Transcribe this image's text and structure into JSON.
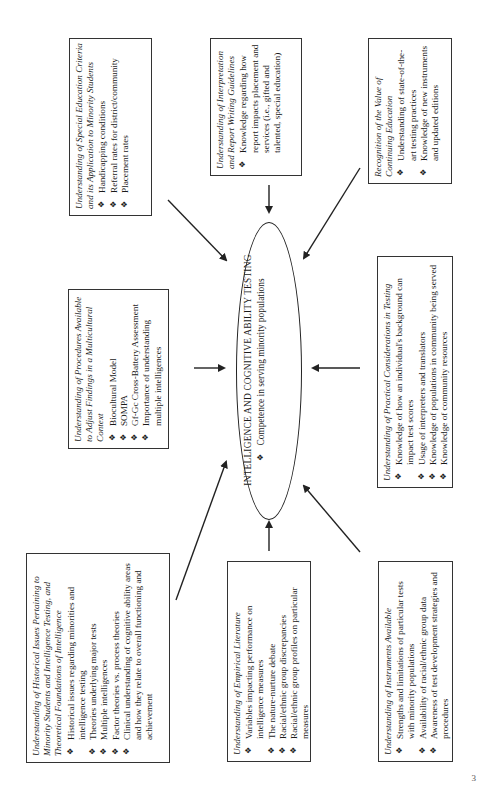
{
  "center": {
    "title": "INTELLIGENCE AND COGNITIVE ABILITY TESTING",
    "bullets": [
      "Competence in serving minority populations"
    ]
  },
  "boxes": {
    "special_education": {
      "title": "Understanding of Special Education Criteria and its Application to Minority Students",
      "bullets": [
        "Handicapping conditions",
        "Referral rates for district/community",
        "Placement rates"
      ]
    },
    "interpretation": {
      "title": "Understanding of Interpretation and Report Writing Guidelines",
      "bullets": [
        "Knowledge regarding how report impacts placement and services (i.e., gifted and talented, special education)"
      ]
    },
    "continuing_education": {
      "title": "Recognition of the Value of Continuing Education",
      "bullets": [
        "Understanding of state-of-the-art testing practices",
        "Knowledge of new instruments and updated editions"
      ]
    },
    "procedures": {
      "title": "Understanding of Procedures Available to Adjust Findings in a Multicultural Context",
      "bullets": [
        "Biocultural Model",
        "SOMPA",
        "Gf-Gc Cross-Battery Assessment",
        "Importance of understanding multiple intelligences"
      ]
    },
    "practical": {
      "title": "Understanding of Practical Considerations in Testing",
      "bullets": [
        "Knowledge of how an individual's background can impact test scores",
        "Usage of interpreters and translators",
        "Knowledge of populations in community being served",
        "Knowledge of community resources"
      ]
    },
    "historical": {
      "title": "Understanding of Historical Issues Pertaining to Minority Students and Intelligence Testing, and Theoretical Foundations of Intelligence",
      "bullets": [
        "Historical issues regarding minorities and intelligence testing",
        "Theories underlying major tests",
        "Multiple intelligences",
        "Factor theories vs. process theories",
        "Clinical understanding of cognitive ability areas and how they relate to overall functioning and achievement"
      ]
    },
    "empirical": {
      "title": "Understanding of Empirical Literature",
      "bullets": [
        "Variables impacting performance on intelligence measures",
        "The nature-nurture debate",
        "Racial/ethnic group discrepancies",
        "Racial/ethnic group profiles on particular measures"
      ]
    },
    "instruments": {
      "title": "Understanding of Instruments Available",
      "bullets": [
        "Strengths and limitations of particular tests with minority populations",
        "Availability of racial/ethnic group data",
        "Awareness of test development strategies and procedures"
      ]
    }
  },
  "page_number": "3"
}
